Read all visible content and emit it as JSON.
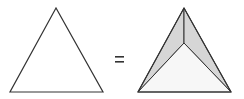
{
  "diagram": {
    "left_shape": {
      "type": "triangle",
      "points": "56,8 10,92 103,92",
      "fill": "#ffffff",
      "stroke": "#333333"
    },
    "operator": {
      "symbol": "=",
      "color": "#333333"
    },
    "right_shape": {
      "type": "triangular-pyramid-top-view",
      "outline": "184,8 138,92 231,92",
      "inner_point": "184,43",
      "facet_left_fill": "#d6d6d6",
      "facet_right_fill": "#d6d6d6",
      "facet_bottom_fill": "#f5f5f5",
      "stroke": "#333333"
    }
  }
}
